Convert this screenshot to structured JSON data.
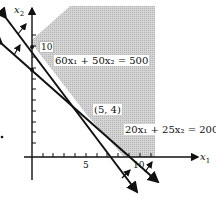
{
  "diagram": {
    "type": "linear-programming-feasible-region",
    "axes": {
      "x_label": "x",
      "x_sub": "1",
      "y_label": "x",
      "y_sub": "2",
      "x_ticks": [
        "5",
        "10"
      ],
      "y_ticks": [
        "5",
        "10"
      ]
    },
    "constraints": [
      {
        "label": "60x₁ + 50x₂ = 500"
      },
      {
        "label": "20x₁ + 25x₂ = 200"
      }
    ],
    "vertex": {
      "label": "(5, 4)"
    },
    "colors": {
      "feasible_region": "#c8c8c8",
      "lines": "#111111",
      "background": "#ffffff"
    }
  }
}
